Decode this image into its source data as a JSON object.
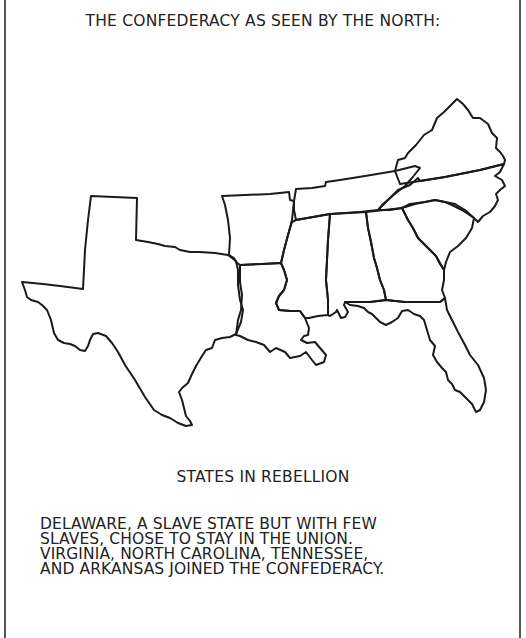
{
  "comic": {
    "title": "THE CONFEDERACY AS SEEN BY THE NORTH:",
    "caption": "STATES IN REBELLION",
    "note_lines": [
      "DELAWARE, A SLAVE STATE BUT WITH FEW",
      "SLAVES, CHOSE TO STAY IN THE UNION.",
      "VIRGINIA, NORTH CAROLINA, TENNESSEE,",
      "AND ARKANSAS JOINED THE CONFEDERACY."
    ]
  },
  "map": {
    "description": "Outline map of the Confederate states",
    "states": [
      "Texas",
      "Arkansas",
      "Louisiana",
      "Tennessee",
      "Mississippi",
      "Alabama",
      "Georgia",
      "Florida",
      "South Carolina",
      "North Carolina",
      "Virginia"
    ],
    "stroke_color": "#1a1a1a"
  }
}
